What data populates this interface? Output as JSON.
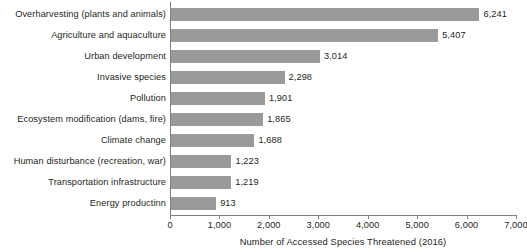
{
  "chart_data": {
    "type": "bar",
    "orientation": "horizontal",
    "title": "",
    "xlabel": "Number of Accessed Species Threatened (2016)",
    "ylabel": "",
    "xlim": [
      0,
      7000
    ],
    "grid": false,
    "legend": null,
    "bar_color": "#9a9a9a",
    "axis_color": "#808080",
    "text_color": "#231f20",
    "xticks": [
      "0",
      "1,000",
      "2,000",
      "3,000",
      "4,000",
      "5,000",
      "6,000",
      "7,000"
    ],
    "xtick_values": [
      0,
      1000,
      2000,
      3000,
      4000,
      5000,
      6000,
      7000
    ],
    "categories": [
      "Overharvesting (plants and animals)",
      "Agriculture and aquaculture",
      "Urban development",
      "Invasive species",
      "Pollution",
      "Ecosystem modification (dams, fire)",
      "Climate change",
      "Human disturbance (recreation, war)",
      "Transportation infrastructure",
      "Energy productinn"
    ],
    "values": [
      6241,
      5407,
      3014,
      2298,
      1901,
      1865,
      1688,
      1223,
      1219,
      913
    ],
    "value_labels": [
      "6,241",
      "5,407",
      "3,014",
      "2,298",
      "1,901",
      "1,865",
      "1,688",
      "1,223",
      "1,219",
      "913"
    ]
  }
}
